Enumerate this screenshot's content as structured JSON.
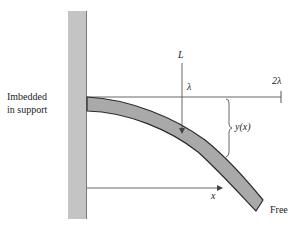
{
  "diagram": {
    "support_label_line1": "Imbedded",
    "support_label_line2": "in support",
    "load_label": "L",
    "lambda_label": "λ",
    "two_lambda_label": "2λ",
    "deflection_label": "y(x)",
    "x_label": "x",
    "free_label": "Free"
  },
  "colors": {
    "wall_fill": "#c4c4c4",
    "wall_edge": "#7a7a7a",
    "beam_fill": "#a9a9a9",
    "beam_outline": "#2a2a2a",
    "line": "#555555",
    "text": "#222222"
  }
}
